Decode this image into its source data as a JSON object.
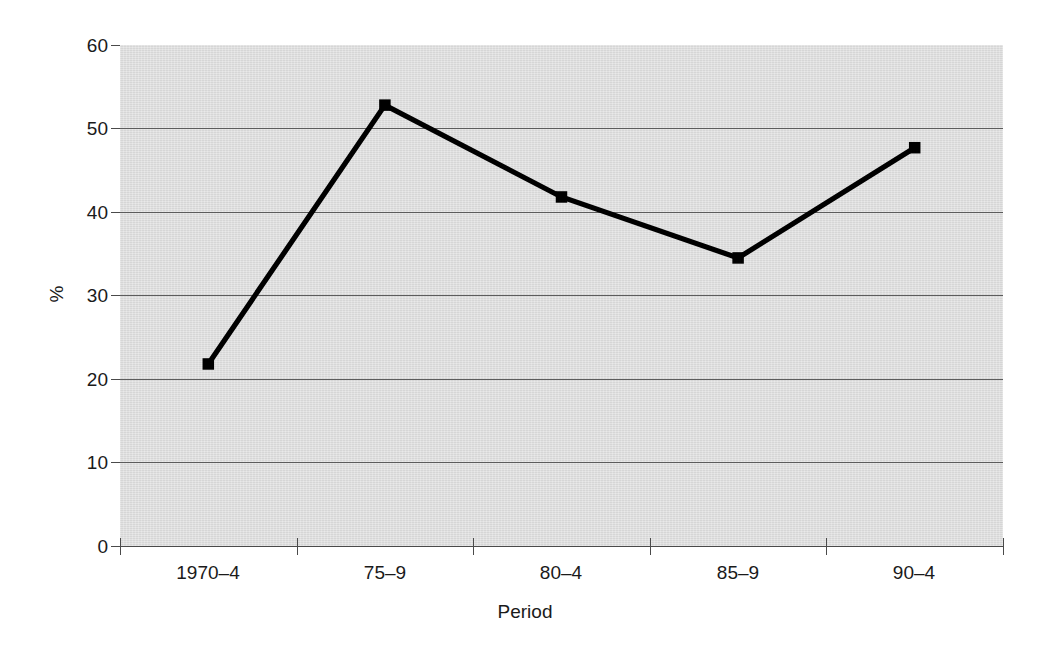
{
  "chart_data": {
    "type": "line",
    "title": "",
    "subtitle": "",
    "xlabel": "Period",
    "ylabel": "%",
    "categories": [
      "1970–4",
      "75–9",
      "80–4",
      "85–9",
      "90–4"
    ],
    "values": [
      21.8,
      52.8,
      41.8,
      34.5,
      47.7
    ],
    "series": [
      {
        "name": "",
        "values": [
          21.8,
          52.8,
          41.8,
          34.5,
          47.7
        ],
        "marker": "square",
        "color": "#000000"
      }
    ],
    "ylim": [
      0,
      60
    ],
    "ytick_values": [
      0,
      10,
      20,
      30,
      40,
      50,
      60
    ],
    "ytick_labels": [
      "0",
      "10",
      "20",
      "30",
      "40",
      "50",
      "60"
    ],
    "grid": "horizontal",
    "legend": "none",
    "plot_background": "#d6d6d6",
    "gridline_color": "#5c5c5c",
    "line_color": "#000000",
    "axis_color": "#4a4a4a",
    "annotations": []
  }
}
